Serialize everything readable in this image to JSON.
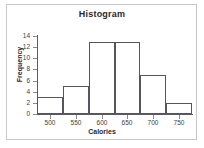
{
  "figure": {
    "title": "Histogram",
    "background_color": "#ffffff",
    "frame_color": "#c9c9c9",
    "axis_color": "#55555f"
  },
  "chart_data": {
    "type": "bar",
    "title": "Histogram",
    "subtitle": "",
    "xlabel": "Calories",
    "ylabel": "Frequency",
    "grid": false,
    "legend": "none",
    "bin_width": 50,
    "bin_edges": [
      475,
      525,
      575,
      625,
      675,
      725,
      775
    ],
    "categories": [
      "475-525",
      "525-575",
      "575-625",
      "625-675",
      "675-725",
      "725-775"
    ],
    "values": [
      3,
      5,
      13,
      13,
      7,
      2
    ],
    "bar_fill": "none",
    "bar_edge_color": "#55555f",
    "xlim": [
      475,
      775
    ],
    "ylim": [
      0,
      14
    ],
    "xticks": [
      500,
      550,
      600,
      650,
      700,
      750
    ],
    "yticks": [
      0,
      2,
      4,
      6,
      8,
      10,
      12,
      14
    ],
    "xtick_labels": [
      "500",
      "550",
      "600",
      "650",
      "700",
      "750"
    ],
    "ytick_labels": [
      "0",
      "2",
      "4",
      "6",
      "8",
      "10",
      "12",
      "14"
    ]
  }
}
